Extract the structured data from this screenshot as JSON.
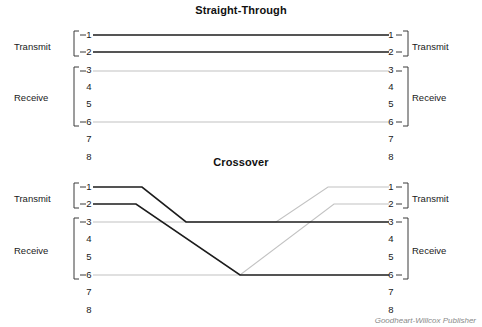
{
  "figure": {
    "width": 482,
    "height": 327,
    "background": "#ffffff",
    "credit": "Goodheart-Willcox Publisher"
  },
  "colors": {
    "wire_dark": "#1c1c1c",
    "wire_light": "#c2c2c2",
    "bracket": "#3a3a3a",
    "text": "#1a1a1a",
    "credit_text": "#8a8a8a"
  },
  "diagrams": [
    {
      "id": "straight-through",
      "title": "Straight-Through",
      "left_connector": {
        "pins": [
          "1",
          "2",
          "3",
          "4",
          "5",
          "6",
          "7",
          "8"
        ],
        "groups": [
          {
            "label": "Transmit",
            "pins": [
              "1",
              "2"
            ]
          },
          {
            "label": "Receive",
            "pins": [
              "3",
              "4",
              "5",
              "6"
            ]
          }
        ]
      },
      "right_connector": {
        "pins": [
          "1",
          "2",
          "3",
          "4",
          "5",
          "6",
          "7",
          "8"
        ],
        "groups": [
          {
            "label": "Transmit",
            "pins": [
              "1",
              "2"
            ]
          },
          {
            "label": "Receive",
            "pins": [
              "3",
              "4",
              "5",
              "6"
            ]
          }
        ]
      },
      "connections": [
        {
          "from_pin": "1",
          "to_pin": "1",
          "style": "dark"
        },
        {
          "from_pin": "2",
          "to_pin": "2",
          "style": "dark"
        },
        {
          "from_pin": "3",
          "to_pin": "3",
          "style": "light"
        },
        {
          "from_pin": "6",
          "to_pin": "6",
          "style": "light"
        }
      ]
    },
    {
      "id": "crossover",
      "title": "Crossover",
      "left_connector": {
        "pins": [
          "1",
          "2",
          "3",
          "4",
          "5",
          "6",
          "7",
          "8"
        ],
        "groups": [
          {
            "label": "Transmit",
            "pins": [
              "1",
              "2"
            ]
          },
          {
            "label": "Receive",
            "pins": [
              "3",
              "4",
              "5",
              "6"
            ]
          }
        ]
      },
      "right_connector": {
        "pins": [
          "1",
          "2",
          "3",
          "4",
          "5",
          "6",
          "7",
          "8"
        ],
        "groups": [
          {
            "label": "Transmit",
            "pins": [
              "1",
              "2"
            ]
          },
          {
            "label": "Receive",
            "pins": [
              "3",
              "4",
              "5",
              "6"
            ]
          }
        ]
      },
      "connections": [
        {
          "from_pin": "1",
          "to_pin": "3",
          "style": "dark"
        },
        {
          "from_pin": "2",
          "to_pin": "6",
          "style": "dark"
        },
        {
          "from_pin": "3",
          "to_pin": "1",
          "style": "light"
        },
        {
          "from_pin": "6",
          "to_pin": "2",
          "style": "light"
        }
      ]
    }
  ],
  "labels": {
    "st_left_transmit": "Transmit",
    "st_left_receive": "Receive",
    "st_right_transmit": "Transmit",
    "st_right_receive": "Receive",
    "co_left_transmit": "Transmit",
    "co_left_receive": "Receive",
    "co_right_transmit": "Transmit",
    "co_right_receive": "Receive",
    "st_left_pins": [
      "1",
      "2",
      "3",
      "4",
      "5",
      "6",
      "7",
      "8"
    ],
    "st_right_pins": [
      "1",
      "2",
      "3",
      "4",
      "5",
      "6",
      "7",
      "8"
    ],
    "co_left_pins": [
      "1",
      "2",
      "3",
      "4",
      "5",
      "6",
      "7",
      "8"
    ],
    "co_right_pins": [
      "1",
      "2",
      "3",
      "4",
      "5",
      "6",
      "7",
      "8"
    ]
  }
}
